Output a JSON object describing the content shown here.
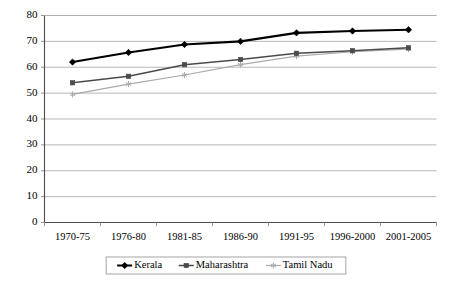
{
  "chart_data": {
    "type": "line",
    "title": "",
    "subtitle": "",
    "xlabel": "",
    "ylabel": "",
    "categories": [
      "1970-75",
      "1976-80",
      "1981-85",
      "1986-90",
      "1991-95",
      "1996-2000",
      "2001-2005"
    ],
    "ylim": [
      0,
      80
    ],
    "ytick_step": 10,
    "yticks": [
      "0",
      "10",
      "20",
      "30",
      "40",
      "50",
      "60",
      "70",
      "80"
    ],
    "grid": "horizontal",
    "legend_position": "bottom-center",
    "series": [
      {
        "name": "Kerala",
        "color": "#000000",
        "marker": "diamond",
        "line_width": 2.1,
        "values": [
          62.0,
          65.7,
          68.8,
          70.0,
          73.3,
          74.0,
          74.5
        ]
      },
      {
        "name": "Maharashtra",
        "color": "#4a4a4a",
        "marker": "square",
        "line_width": 1.5,
        "values": [
          54.0,
          56.5,
          61.0,
          63.0,
          65.4,
          66.4,
          67.5
        ]
      },
      {
        "name": "Tamil Nadu",
        "color": "#aaaaaa",
        "marker": "star",
        "line_width": 1.2,
        "values": [
          49.5,
          53.5,
          57.0,
          61.0,
          64.3,
          66.0,
          67.0
        ]
      }
    ]
  }
}
